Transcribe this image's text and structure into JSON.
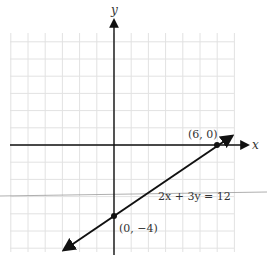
{
  "figure": {
    "axis_labels": {
      "x": "x",
      "y": "y"
    },
    "equation": "2x + 3y = 12",
    "points": [
      {
        "label": "(6, 0)",
        "x": 6,
        "y": 0
      },
      {
        "label": "(0, −4)",
        "x": 0,
        "y": -4
      }
    ],
    "grid": {
      "x_min": -6,
      "x_max": 7,
      "y_min": -6,
      "y_max": 6,
      "unit_px": 17.2
    },
    "colors": {
      "axis": "#111111",
      "line": "#111111",
      "grid": "#e2e2e2",
      "text": "#333333",
      "artifact": "#9a9a9a"
    }
  }
}
